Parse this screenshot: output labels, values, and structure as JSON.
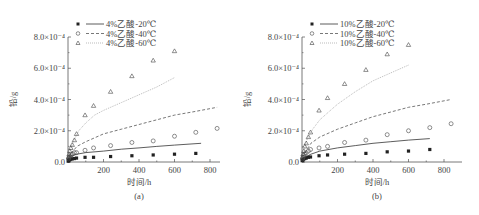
{
  "chart_data": [
    {
      "type": "scatter",
      "panel_label": "(a)",
      "xlabel": "时间/h",
      "ylabel": "铅/g",
      "xlim": [
        0,
        900
      ],
      "ylim": [
        0,
        0.0008
      ],
      "xticks": [
        "200",
        "400",
        "600",
        "800"
      ],
      "yticks": [
        "0.0",
        "2.0×10⁻⁴",
        "4.0×10⁻⁴",
        "6.0×10⁻⁴",
        "8.0×10⁻⁴"
      ],
      "legend_position": "top-left",
      "grid": false,
      "series": [
        {
          "name": "4%乙酸-20℃",
          "marker": "filled-square",
          "line": "solid",
          "x": [
            1,
            3,
            6,
            10,
            16,
            24,
            36,
            48,
            96,
            144,
            240,
            360,
            480,
            600,
            720
          ],
          "y": [
            5e-06,
            1e-05,
            1.3e-05,
            1.5e-05,
            1.8e-05,
            2e-05,
            2.2e-05,
            2.5e-05,
            3e-05,
            3e-05,
            3.5e-05,
            4e-05,
            4.5e-05,
            5e-05,
            5.5e-05
          ],
          "fit_x": [
            0,
            50,
            100,
            200,
            300,
            400,
            500,
            600,
            750
          ],
          "fit_y": [
            3e-05,
            5e-05,
            6e-05,
            7e-05,
            8.2e-05,
            9e-05,
            0.0001,
            0.000108,
            0.00012
          ]
        },
        {
          "name": "4%乙酸-40℃",
          "marker": "open-circle",
          "line": "dashed",
          "x": [
            3,
            6,
            10,
            16,
            24,
            36,
            48,
            96,
            144,
            240,
            360,
            480,
            600,
            720,
            840
          ],
          "y": [
            2e-05,
            3e-05,
            3.5e-05,
            4e-05,
            5e-05,
            6e-05,
            6e-05,
            7.5e-05,
            9e-05,
            0.000105,
            0.000125,
            0.000135,
            0.000165,
            0.00019,
            0.000215
          ],
          "fit_x": [
            0,
            50,
            100,
            200,
            300,
            400,
            500,
            600,
            700,
            840
          ],
          "fit_y": [
            3e-05,
            0.0001,
            0.00013,
            0.00018,
            0.00021,
            0.00024,
            0.00027,
            0.0003,
            0.00032,
            0.00035
          ]
        },
        {
          "name": "4%乙酸-60℃",
          "marker": "open-triangle",
          "line": "dotted",
          "x": [
            3,
            6,
            10,
            16,
            24,
            36,
            48,
            96,
            144,
            240,
            360,
            480,
            600
          ],
          "y": [
            3e-05,
            5e-05,
            7e-05,
            9e-05,
            0.00011,
            0.00014,
            0.00018,
            0.0003,
            0.00036,
            0.00045,
            0.00055,
            0.00065,
            0.00071
          ],
          "fit_x": [
            0,
            30,
            60,
            100,
            150,
            200,
            300,
            400,
            500,
            600
          ],
          "fit_y": [
            3e-05,
            0.00013,
            0.0002,
            0.00025,
            0.0003,
            0.00033,
            0.00038,
            0.00043,
            0.00048,
            0.00054
          ]
        }
      ]
    },
    {
      "type": "scatter",
      "panel_label": "(b)",
      "xlabel": "时间/h",
      "ylabel": "铅/g",
      "xlim": [
        0,
        900
      ],
      "ylim": [
        0,
        0.0008
      ],
      "xticks": [
        "200",
        "400",
        "600",
        "800"
      ],
      "yticks": [
        "0.0",
        "2.0×10⁻⁴",
        "4.0×10⁻⁴",
        "6.0×10⁻⁴",
        "8.0×10⁻⁴"
      ],
      "legend_position": "top-left",
      "grid": false,
      "series": [
        {
          "name": "10%乙酸-20℃",
          "marker": "filled-square",
          "line": "solid",
          "x": [
            1,
            3,
            6,
            10,
            16,
            24,
            36,
            48,
            96,
            144,
            240,
            360,
            480,
            600,
            720
          ],
          "y": [
            8e-06,
            1.2e-05,
            1.5e-05,
            2e-05,
            2.2e-05,
            2.5e-05,
            3e-05,
            3.2e-05,
            4e-05,
            4.5e-05,
            5e-05,
            5.5e-05,
            6.5e-05,
            7e-05,
            8e-05
          ],
          "fit_x": [
            0,
            50,
            100,
            200,
            300,
            400,
            500,
            600,
            720
          ],
          "fit_y": [
            2e-05,
            5e-05,
            7e-05,
            9e-05,
            0.000105,
            0.00012,
            0.00013,
            0.00014,
            0.00015
          ]
        },
        {
          "name": "10%乙酸-40℃",
          "marker": "open-circle",
          "line": "dashed",
          "x": [
            3,
            6,
            10,
            16,
            24,
            36,
            48,
            96,
            144,
            240,
            360,
            480,
            600,
            720,
            840
          ],
          "y": [
            2e-05,
            3e-05,
            4e-05,
            5e-05,
            6e-05,
            7e-05,
            8e-05,
            9e-05,
            0.0001,
            0.000125,
            0.00014,
            0.000175,
            0.0002,
            0.00022,
            0.000245
          ],
          "fit_x": [
            0,
            50,
            100,
            200,
            300,
            400,
            500,
            600,
            700,
            840
          ],
          "fit_y": [
            3e-05,
            0.00012,
            0.00016,
            0.00021,
            0.00025,
            0.00029,
            0.00032,
            0.00035,
            0.00037,
            0.0004
          ]
        },
        {
          "name": "10%乙酸-60℃",
          "marker": "open-triangle",
          "line": "dotted",
          "x": [
            3,
            6,
            10,
            16,
            24,
            36,
            48,
            96,
            144,
            240,
            360,
            480,
            600
          ],
          "y": [
            3e-05,
            5e-05,
            7e-05,
            0.0001,
            0.00012,
            0.00016,
            0.00019,
            0.00033,
            0.00041,
            0.0005,
            0.00059,
            0.00069,
            0.00075
          ],
          "fit_x": [
            0,
            30,
            60,
            100,
            150,
            200,
            300,
            400,
            500,
            600
          ],
          "fit_y": [
            3e-05,
            0.00015,
            0.00021,
            0.00027,
            0.00032,
            0.00037,
            0.00045,
            0.00052,
            0.00057,
            0.00062
          ]
        }
      ]
    }
  ]
}
